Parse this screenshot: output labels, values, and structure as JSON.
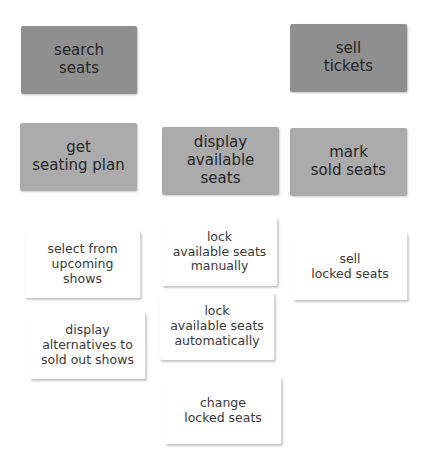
{
  "diagram": {
    "type": "user-story-map",
    "colors": {
      "activity": "#8f8f8f",
      "task": "#ababab",
      "story": "#ffffff",
      "text": "#2e2e2e"
    },
    "activities": [
      {
        "label": "search\nseats"
      },
      {
        "label": "sell\ntickets"
      }
    ],
    "tasks": [
      {
        "label": "get\nseating plan"
      },
      {
        "label": "display\navailable\nseats"
      },
      {
        "label": "mark\nsold seats"
      }
    ],
    "stories": [
      {
        "label": "select from\nupcoming\nshows"
      },
      {
        "label": "display\nalternatives to\nsold out shows"
      },
      {
        "label": "lock\navailable seats\nmanually"
      },
      {
        "label": "lock\navailable seats\nautomatically"
      },
      {
        "label": "change\nlocked seats"
      },
      {
        "label": "sell\nlocked seats"
      }
    ]
  }
}
